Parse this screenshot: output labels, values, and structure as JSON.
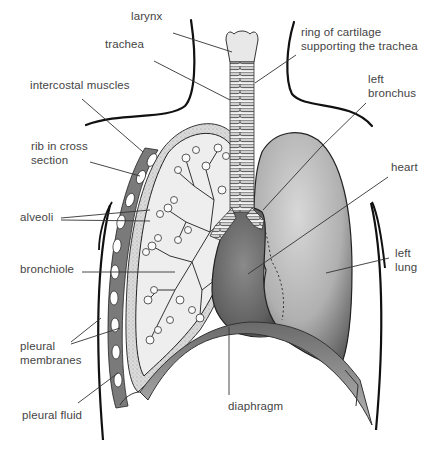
{
  "diagram": {
    "labels": [
      {
        "id": "larynx",
        "text": "larynx",
        "x": 131,
        "y": 17,
        "line": [
          173,
          33,
          232,
          52
        ]
      },
      {
        "id": "trachea",
        "text": "trachea",
        "x": 105,
        "y": 45,
        "line": [
          154,
          61,
          230,
          100
        ]
      },
      {
        "id": "intercostal-muscles",
        "text": "intercostal muscles",
        "x": 30,
        "y": 79,
        "line": [
          82,
          99,
          143,
          152
        ]
      },
      {
        "id": "rib-in-cross-section",
        "text": "rib in cross\nsection",
        "x": 31,
        "y": 145,
        "line": [
          90,
          162,
          140,
          176
        ]
      },
      {
        "id": "alveoli",
        "text": "alveoli",
        "x": 20,
        "y": 211,
        "line": [
          61,
          218,
          150,
          210
        ],
        "line2": [
          61,
          220,
          150,
          221
        ]
      },
      {
        "id": "bronchiole",
        "text": "bronchiole",
        "x": 20,
        "y": 263,
        "line": [
          82,
          272,
          175,
          272
        ]
      },
      {
        "id": "pleural-membranes",
        "text": "pleural\nmembranes",
        "x": 20,
        "y": 340,
        "line": [
          71,
          342,
          101,
          318
        ],
        "line2": [
          71,
          344,
          120,
          328
        ]
      },
      {
        "id": "pleural-fluid",
        "text": "pleural fluid",
        "x": 22,
        "y": 409,
        "line": [
          78,
          403,
          118,
          373
        ]
      },
      {
        "id": "ring-of-cartilage",
        "text": "ring of cartilage\nsupporting the trachea",
        "x": 301,
        "y": 27,
        "line": [
          296,
          55,
          255,
          83
        ]
      },
      {
        "id": "left-bronchus",
        "text": "left\nbronchus",
        "x": 368,
        "y": 73,
        "line": [
          366,
          103,
          320,
          148
        ],
        "line_ext": [
          320,
          148,
          263,
          210
        ]
      },
      {
        "id": "heart",
        "text": "heart",
        "x": 391,
        "y": 161,
        "line": [
          388,
          177,
          248,
          274
        ]
      },
      {
        "id": "left-lung",
        "text": "left\nlung",
        "x": 395,
        "y": 247,
        "line": [
          389,
          258,
          326,
          273
        ]
      },
      {
        "id": "diaphragm",
        "text": "diaphragm",
        "x": 228,
        "y": 406,
        "line": [
          229,
          327,
          229,
          395
        ]
      }
    ]
  },
  "colors": {
    "label_text": "#444444",
    "leader_line": "#333333",
    "body_outline": "#111111",
    "lung_fill": "#a8a8a8",
    "heart_fill": "#666666",
    "cut_lung_fill": "#eeeeee",
    "pleura_fill": "#cfcfcf",
    "diaphragm_fill": "#8a8a8a",
    "muscle_fill": "#7a7a7a"
  }
}
